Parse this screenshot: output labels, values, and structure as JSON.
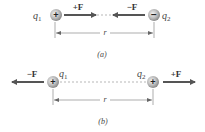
{
  "panels": [
    {
      "caption": "(a)",
      "charge1": {
        "label": "q",
        "sub": "1",
        "sign": "+"
      },
      "charge2": {
        "label": "q",
        "sub": "2",
        "sign": "−"
      },
      "force_left": "+F",
      "force_right": "−F",
      "distance_label": "r"
    },
    {
      "caption": "(b)",
      "charge1": {
        "label": "q",
        "sub": "1",
        "sign": "+"
      },
      "charge2": {
        "label": "q",
        "sub": "2",
        "sign": "+"
      },
      "force_left": "−F",
      "force_right": "+F",
      "distance_label": "r"
    }
  ],
  "colors": {
    "arrow": "#555555",
    "sphere": "#9a9a9a",
    "line": "#777777"
  }
}
